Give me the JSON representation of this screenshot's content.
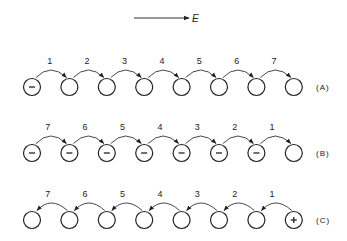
{
  "field": {
    "label": "E",
    "direction": "right"
  },
  "rows": [
    {
      "label": "(A)",
      "charges": [
        "-",
        "",
        "",
        "",
        "",
        "",
        "",
        ""
      ],
      "hop_direction": "right",
      "hop_labels": [
        "1",
        "2",
        "3",
        "4",
        "5",
        "6",
        "7"
      ]
    },
    {
      "label": "(B)",
      "charges": [
        "-",
        "-",
        "-",
        "-",
        "-",
        "-",
        "-",
        ""
      ],
      "hop_direction": "right",
      "hop_labels": [
        "7",
        "6",
        "5",
        "4",
        "3",
        "2",
        "1"
      ]
    },
    {
      "label": "(C)",
      "charges": [
        "",
        "",
        "",
        "",
        "",
        "",
        "",
        "+"
      ],
      "hop_direction": "left",
      "hop_labels": [
        "7",
        "6",
        "5",
        "4",
        "3",
        "2",
        "1"
      ]
    }
  ]
}
